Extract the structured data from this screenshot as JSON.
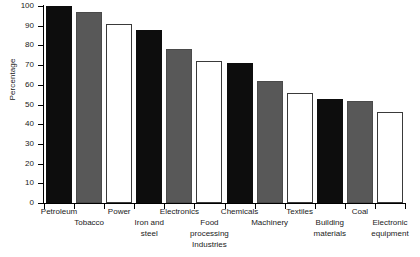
{
  "chart_data": {
    "type": "bar",
    "title": "",
    "xlabel": "Industries",
    "ylabel": "Percentage",
    "ylim": [
      0,
      100
    ],
    "ytick_labels": [
      "0",
      "10",
      "20",
      "30",
      "40",
      "50",
      "60",
      "70",
      "80",
      "90",
      "100"
    ],
    "ytick_values": [
      0,
      10,
      20,
      30,
      40,
      50,
      60,
      70,
      80,
      90,
      100
    ],
    "grid": false,
    "legend": "none",
    "categories": [
      "Petroleum",
      "Tobacco",
      "Power",
      "Iron and steel",
      "Electronics",
      "Food processing",
      "Chemicals",
      "Machinery",
      "Textiles",
      "Building materials",
      "Coal",
      "Electronic equipment"
    ],
    "values": [
      100,
      97,
      91,
      88,
      78,
      72,
      71,
      62,
      56,
      53,
      52,
      46
    ],
    "bar_colors": [
      "black",
      "gray",
      "white",
      "black",
      "gray",
      "white",
      "black",
      "gray",
      "white",
      "black",
      "gray",
      "white"
    ],
    "palette": {
      "black": "#0d0d0d",
      "gray": "#585858",
      "white": "#ffffff",
      "outline": "#3a3a3a",
      "axis": "#000000",
      "text": "#1a1a1a",
      "background": "#ffffff"
    },
    "label_rows": [
      {
        "text": "Petroleum",
        "row": "top"
      },
      {
        "text": "Tobacco",
        "row": "bottom"
      },
      {
        "text": "Power",
        "row": "top"
      },
      {
        "text": "Iron and",
        "row": "bottom",
        "text2": "steel"
      },
      {
        "text": "Electronics",
        "row": "top"
      },
      {
        "text": "Food",
        "row": "bottom",
        "text2": "processing"
      },
      {
        "text": "Chemicals",
        "row": "top"
      },
      {
        "text": "Machinery",
        "row": "bottom"
      },
      {
        "text": "Textiles",
        "row": "top"
      },
      {
        "text": "Building",
        "row": "bottom",
        "text2": "materials"
      },
      {
        "text": "Coal",
        "row": "top"
      },
      {
        "text": "Electronic",
        "row": "bottom",
        "text2": "equipment"
      }
    ]
  }
}
